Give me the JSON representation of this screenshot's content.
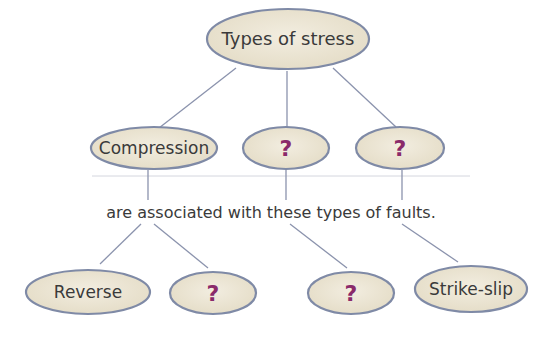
{
  "diagram": {
    "root": {
      "label": "Types of stress"
    },
    "stress_types": [
      {
        "label": "Compression"
      },
      {
        "label": "?"
      },
      {
        "label": "?"
      }
    ],
    "bridge_text": "are associated with these types of faults.",
    "fault_types": [
      {
        "label": "Reverse"
      },
      {
        "label": "?"
      },
      {
        "label": "?"
      },
      {
        "label": "Strike-slip"
      }
    ],
    "colors": {
      "node_fill": "#e9e2cf",
      "node_stroke": "#7f8aa6",
      "link": "#8b93ad",
      "text": "#3a3a3a",
      "question_mark": "#8a2a6a"
    }
  }
}
